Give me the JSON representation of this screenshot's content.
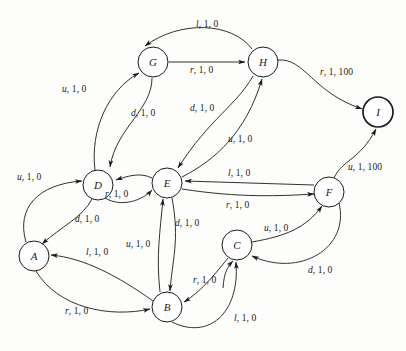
{
  "figure": {
    "type": "state-transition-diagram",
    "width": 406,
    "height": 351,
    "background_color": "#fdfdfc",
    "stroke_color": "#1a1a1a"
  },
  "nodes": [
    {
      "id": "A",
      "label": "A",
      "x": 34,
      "y": 256,
      "r": 15,
      "accepting": false
    },
    {
      "id": "B",
      "label": "B",
      "x": 167,
      "y": 307,
      "r": 15,
      "accepting": false
    },
    {
      "id": "C",
      "label": "C",
      "x": 237,
      "y": 245,
      "r": 15,
      "accepting": false
    },
    {
      "id": "D",
      "label": "D",
      "x": 98,
      "y": 185,
      "r": 15,
      "accepting": false
    },
    {
      "id": "E",
      "label": "E",
      "x": 167,
      "y": 183,
      "r": 15,
      "accepting": false
    },
    {
      "id": "F",
      "label": "F",
      "x": 329,
      "y": 192,
      "r": 15,
      "accepting": false
    },
    {
      "id": "G",
      "label": "G",
      "x": 153,
      "y": 62,
      "r": 15,
      "accepting": false
    },
    {
      "id": "H",
      "label": "H",
      "x": 263,
      "y": 62,
      "r": 15,
      "accepting": false
    },
    {
      "id": "I",
      "label": "I",
      "x": 378,
      "y": 112,
      "r": 15,
      "accepting": true
    }
  ],
  "edges": [
    {
      "id": "G-H-l",
      "from": "H",
      "to": "G",
      "action": "l",
      "cost": "1",
      "reward": "0",
      "label_x": 196,
      "label_y": 20
    },
    {
      "id": "G-H-r",
      "from": "G",
      "to": "H",
      "action": "r",
      "cost": "1",
      "reward": "0",
      "label_x": 190,
      "label_y": 66
    },
    {
      "id": "D-G-u",
      "from": "D",
      "to": "G",
      "action": "u",
      "cost": "1",
      "reward": "0",
      "label_x": 62,
      "label_y": 85
    },
    {
      "id": "G-D-d",
      "from": "G",
      "to": "D",
      "action": "d",
      "cost": "1",
      "reward": "0",
      "label_x": 131,
      "label_y": 109
    },
    {
      "id": "H-E-d",
      "from": "H",
      "to": "E",
      "action": "d",
      "cost": "1",
      "reward": "0",
      "label_x": 190,
      "label_y": 104
    },
    {
      "id": "E-H-u",
      "from": "E",
      "to": "H",
      "action": "u",
      "cost": "1",
      "reward": "0",
      "label_x": 228,
      "label_y": 135
    },
    {
      "id": "H-I-r",
      "from": "H",
      "to": "I",
      "action": "r",
      "cost": "1",
      "reward": "100",
      "label_x": 320,
      "label_y": 68
    },
    {
      "id": "F-I-u",
      "from": "F",
      "to": "I",
      "action": "u",
      "cost": "1",
      "reward": "100",
      "label_x": 348,
      "label_y": 163
    },
    {
      "id": "A-D-u",
      "from": "A",
      "to": "D",
      "action": "u",
      "cost": "1",
      "reward": "0",
      "label_x": 17,
      "label_y": 173
    },
    {
      "id": "D-A-d",
      "from": "D",
      "to": "A",
      "action": "d",
      "cost": "1",
      "reward": "0",
      "label_x": 75,
      "label_y": 215
    },
    {
      "id": "D-E-r",
      "from": "D",
      "to": "E",
      "action": "r",
      "cost": "1",
      "reward": "0",
      "label_x": 105,
      "label_y": 190
    },
    {
      "id": "F-E-l",
      "from": "F",
      "to": "E",
      "action": "l",
      "cost": "1",
      "reward": "0",
      "label_x": 228,
      "label_y": 169
    },
    {
      "id": "E-F-r",
      "from": "E",
      "to": "F",
      "action": "r",
      "cost": "1",
      "reward": "0",
      "label_x": 226,
      "label_y": 201
    },
    {
      "id": "E-B-d",
      "from": "E",
      "to": "B",
      "action": "d",
      "cost": "1",
      "reward": "0",
      "label_x": 175,
      "label_y": 219
    },
    {
      "id": "B-E-u",
      "from": "B",
      "to": "E",
      "action": "u",
      "cost": "1",
      "reward": "0",
      "label_x": 126,
      "label_y": 240
    },
    {
      "id": "B-A-l",
      "from": "B",
      "to": "A",
      "action": "l",
      "cost": "1",
      "reward": "0",
      "label_x": 86,
      "label_y": 248
    },
    {
      "id": "A-B-r",
      "from": "A",
      "to": "B",
      "action": "r",
      "cost": "1",
      "reward": "0",
      "label_x": 65,
      "label_y": 307
    },
    {
      "id": "C-F-u",
      "from": "C",
      "to": "F",
      "action": "u",
      "cost": "1",
      "reward": "0",
      "label_x": 264,
      "label_y": 224
    },
    {
      "id": "F-C-d",
      "from": "F",
      "to": "C",
      "action": "d",
      "cost": "1",
      "reward": "0",
      "label_x": 308,
      "label_y": 266
    },
    {
      "id": "C-B-r",
      "from": "C",
      "to": "B",
      "action": "r",
      "cost": "1",
      "reward": "0",
      "label_x": 193,
      "label_y": 276
    },
    {
      "id": "B-C-l",
      "from": "B",
      "to": "C",
      "action": "l",
      "cost": "1",
      "reward": "0",
      "label_x": 234,
      "label_y": 314
    }
  ]
}
